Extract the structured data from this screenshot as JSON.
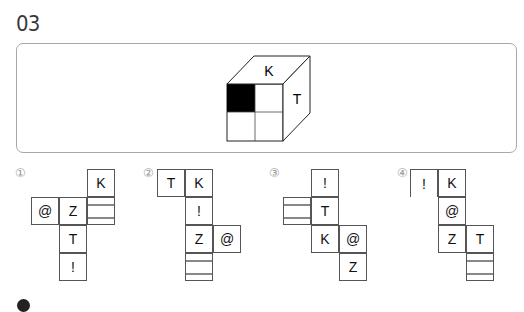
{
  "question": {
    "number": "03",
    "cube": {
      "top_face": "K",
      "right_face": "T",
      "front_face_pattern": "2x2 grid, top-left cell black"
    }
  },
  "options": [
    {
      "label": "①",
      "cells": [
        {
          "text": "K",
          "x": 87,
          "y": 169
        },
        {
          "text": "@",
          "x": 31,
          "y": 197
        },
        {
          "text": "Z",
          "x": 59,
          "y": 197
        },
        {
          "pattern": [
            false,
            true,
            false,
            false
          ],
          "x": 87,
          "y": 197
        },
        {
          "text": "T",
          "x": 59,
          "y": 225
        },
        {
          "text": "!",
          "x": 59,
          "y": 253
        }
      ]
    },
    {
      "label": "②",
      "cells": [
        {
          "text": "T",
          "x": 157,
          "y": 169
        },
        {
          "text": "K",
          "x": 185,
          "y": 169
        },
        {
          "text": "!",
          "x": 185,
          "y": 197
        },
        {
          "text": "Z",
          "x": 185,
          "y": 225
        },
        {
          "text": "@",
          "x": 213,
          "y": 225
        },
        {
          "pattern": [
            false,
            false,
            false,
            true
          ],
          "x": 185,
          "y": 253
        }
      ]
    },
    {
      "label": "③",
      "cells": [
        {
          "text": "!",
          "x": 311,
          "y": 169
        },
        {
          "pattern": [
            false,
            true,
            false,
            false
          ],
          "x": 283,
          "y": 197
        },
        {
          "text": "T",
          "x": 311,
          "y": 197
        },
        {
          "text": "K",
          "x": 311,
          "y": 225
        },
        {
          "text": "@",
          "x": 339,
          "y": 225
        },
        {
          "text": "Z",
          "x": 339,
          "y": 253
        }
      ]
    },
    {
      "label": "④",
      "cells": [
        {
          "text": "!",
          "x": 410,
          "y": 169
        },
        {
          "text": "K",
          "x": 438,
          "y": 169
        },
        {
          "text": "@",
          "x": 438,
          "y": 197
        },
        {
          "text": "Z",
          "x": 438,
          "y": 225
        },
        {
          "text": "T",
          "x": 466,
          "y": 225
        },
        {
          "pattern": [
            false,
            false,
            true,
            false
          ],
          "x": 466,
          "y": 253
        }
      ]
    }
  ],
  "option_labels": [
    "①",
    "②",
    "③",
    "④"
  ]
}
